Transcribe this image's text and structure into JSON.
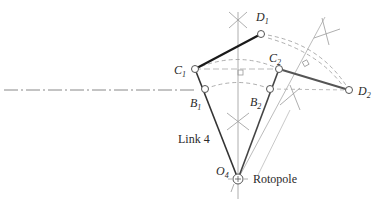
{
  "diagram": {
    "points": {
      "D1": {
        "label": "D",
        "sub": "1",
        "x": 261,
        "y": 34
      },
      "C1": {
        "label": "C",
        "sub": "1",
        "x": 195,
        "y": 69
      },
      "C2": {
        "label": "C",
        "sub": "2",
        "x": 279,
        "y": 69
      },
      "B1": {
        "label": "B",
        "sub": "1",
        "x": 205,
        "y": 89
      },
      "B2": {
        "label": "B",
        "sub": "2",
        "x": 270,
        "y": 89
      },
      "D2": {
        "label": "D",
        "sub": "2",
        "x": 349,
        "y": 90
      },
      "O4": {
        "label": "O",
        "sub": "4",
        "x": 238,
        "y": 179
      }
    },
    "labels": {
      "link": "Link 4",
      "rotopole": "Rotopole"
    },
    "colors": {
      "link_line": "#1a1a1a",
      "link_line_2": "#555555",
      "construction": "#999999",
      "centerline": "#888888"
    }
  }
}
